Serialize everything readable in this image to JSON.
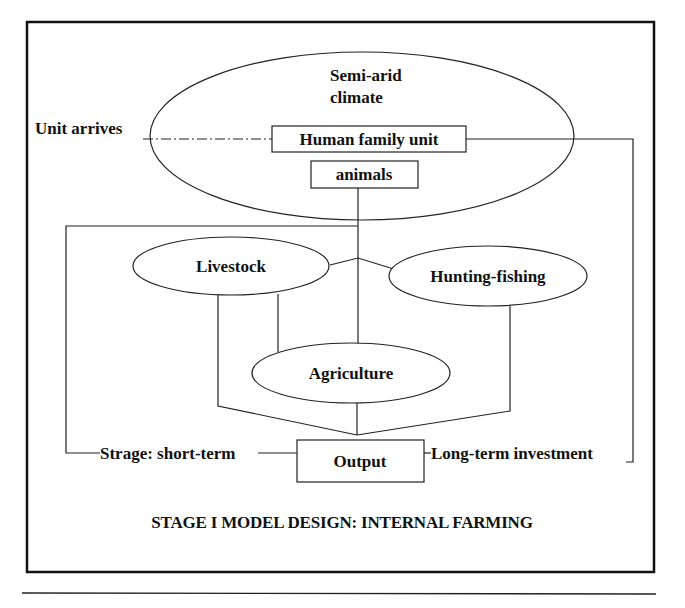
{
  "diagram": {
    "title": "STAGE I MODEL DESIGN: INTERNAL FARMING",
    "nodes": {
      "climate": {
        "line1": "Semi-arid",
        "line2": "climate",
        "shape": "ellipse"
      },
      "human_family_unit": {
        "label": "Human family unit",
        "shape": "rectangle"
      },
      "animals": {
        "label": "animals",
        "shape": "rectangle"
      },
      "livestock": {
        "label": "Livestock",
        "shape": "ellipse"
      },
      "hunting_fishing": {
        "label": "Hunting-fishing",
        "shape": "ellipse"
      },
      "agriculture": {
        "label": "Agriculture",
        "shape": "ellipse"
      },
      "output": {
        "label": "Output",
        "shape": "rectangle"
      }
    },
    "edge_labels": {
      "unit_arrives": "Unit arrives",
      "storage_short_term": "Strage: short-term",
      "long_term_investment": "Long-term investment"
    },
    "edges": [
      {
        "from": "Unit arrives",
        "to": "Human family unit",
        "style": "dash-dot"
      },
      {
        "from": "animals",
        "to": "Livestock / Hunting-fishing / Agriculture",
        "style": "solid"
      },
      {
        "from": "Livestock",
        "to": "Output",
        "style": "solid"
      },
      {
        "from": "Hunting-fishing",
        "to": "Output",
        "style": "solid"
      },
      {
        "from": "Agriculture",
        "to": "Output",
        "style": "solid"
      },
      {
        "from": "Output",
        "to": "animals (feedback)",
        "label": "Strage: short-term",
        "style": "solid"
      },
      {
        "from": "Output",
        "to": "Human family unit (feedback)",
        "label": "Long-term investment",
        "style": "solid"
      }
    ],
    "colors": {
      "stroke": "#222222",
      "text": "#111111",
      "background": "#ffffff"
    }
  }
}
